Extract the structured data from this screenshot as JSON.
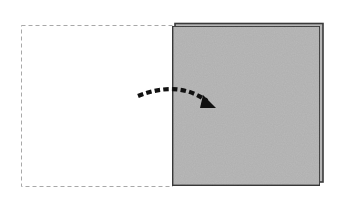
{
  "diagram": {
    "type": "origami-fold-step",
    "colors": {
      "background": "#ffffff",
      "paper_colored_side": "#b9b9b9",
      "paper_edge": "#3a3a3a",
      "dashed_outline": "#a8a8a8",
      "arrow": "#111111"
    },
    "elements": {
      "original_position_outline": {
        "x": 21,
        "y": 25,
        "width": 151,
        "height": 162,
        "style": "dashed"
      },
      "folded_flap_back_layer": {
        "x": 175,
        "y": 23,
        "width": 148,
        "height": 159
      },
      "folded_flap_front": {
        "x": 172,
        "y": 26,
        "width": 148,
        "height": 160
      },
      "fold_arrow": {
        "start": [
          138,
          95
        ],
        "end": [
          215,
          110
        ],
        "style": "dashed-curved",
        "direction": "left-to-right"
      }
    }
  }
}
